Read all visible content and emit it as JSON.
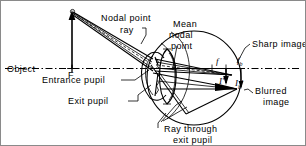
{
  "figure": {
    "domain": "diagram",
    "background_color": "#ffffff",
    "ink_color": "#000000",
    "border_color": "#8a8a8a",
    "width": 306,
    "height": 146
  },
  "labels": {
    "object": "Object",
    "nodal_point_ray_line1": "Nodal point",
    "nodal_point_ray_line2": "ray",
    "mean_nodal_point_line1": "Mean",
    "mean_nodal_point_line2": "nodal",
    "mean_nodal_point_line3": "point",
    "sharp_image": "Sharp image",
    "entrance_pupil": "Entrance pupil",
    "exit_pupil": "Exit pupil",
    "blurred_image_line1": "Blurred",
    "blurred_image_line2": "image",
    "ray_through_exit_pupil_line1": "Ray through",
    "ray_through_exit_pupil_line2": "exit pupil",
    "focal_point_F": "F"
  },
  "math_symbols": {
    "focal_length": "f",
    "blur_focal_length": "f",
    "blur_focal_length_sub": "b",
    "sharp_image_height": "I",
    "sharp_image_height_prime": "′",
    "blurred_image_height": "I",
    "blurred_image_height_sub": "b",
    "blurred_image_height_prime": "′"
  },
  "elements": {
    "optical_axis": "horizontal optical axis dash-dot line",
    "object_arrow": "upward arrow at left representing object height",
    "eye_globe": "large circle representing the eyeball",
    "cornea": "anterior corneal bulge on left of globe",
    "crystalline_lens": "biconvex lens inside globe",
    "iris_pupil": "iris aperture in front of lens",
    "chief_rays": "ray bundle from object tip to retina",
    "nodal_ray": "dashed ray through mean nodal point",
    "exit_pupil_ray": "ray through the exit pupil to blurred image point"
  }
}
